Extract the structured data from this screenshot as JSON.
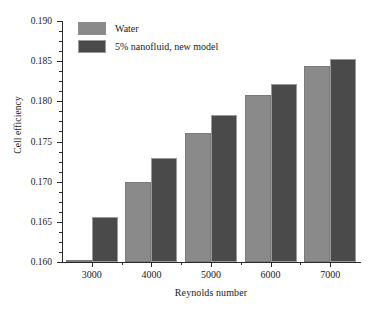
{
  "chart_data": {
    "type": "bar",
    "title": "",
    "xlabel": "Reynolds number",
    "ylabel": "Cell efficiency",
    "categories": [
      "3000",
      "4000",
      "5000",
      "6000",
      "7000"
    ],
    "series": [
      {
        "name": "Water",
        "color": "#8a8a8a",
        "values": [
          0.1603,
          0.17,
          0.176,
          0.1808,
          0.1844
        ]
      },
      {
        "name": "5% nanofluid, new model",
        "color": "#4a4a4a",
        "values": [
          0.1656,
          0.173,
          0.1783,
          0.1821,
          0.1853
        ]
      }
    ],
    "ylim": [
      0.16,
      0.19
    ],
    "yticks": [
      "0.160",
      "0.165",
      "0.170",
      "0.175",
      "0.180",
      "0.185",
      "0.190"
    ],
    "ytick_values": [
      0.16,
      0.165,
      0.17,
      0.175,
      0.18,
      0.185,
      0.19
    ],
    "yminor_step": 0.00125,
    "grid": false,
    "legend_position": "top-left"
  }
}
